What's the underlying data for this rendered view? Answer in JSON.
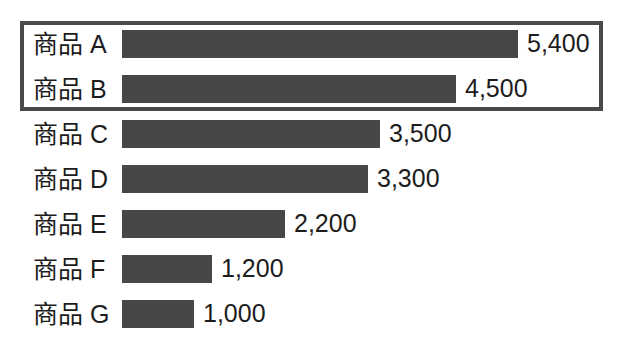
{
  "chart_data": {
    "type": "bar",
    "orientation": "horizontal",
    "title": "",
    "subtitle": "",
    "xlabel": "",
    "ylabel": "",
    "categories": [
      "商品 A",
      "商品 B",
      "商品 C",
      "商品 D",
      "商品 E",
      "商品 F",
      "商品 G"
    ],
    "values": [
      5400,
      4500,
      3500,
      3300,
      2200,
      1200,
      1000
    ],
    "value_labels": [
      "5,400",
      "4,500",
      "3,500",
      "3,300",
      "2,200",
      "1,200",
      "1,000"
    ],
    "xlim": [
      0,
      5400
    ],
    "grid": false,
    "legend": null,
    "annotations": [
      {
        "type": "highlight-rectangle",
        "covers_categories": [
          "商品 A",
          "商品 B"
        ],
        "color": "#4a4a4a"
      }
    ],
    "bar_color": "#474747",
    "text_color": "#1c1c1c",
    "background_color": "#ffffff"
  },
  "rows": [
    {
      "label": "商品 A",
      "value": 5400,
      "value_label": "5,400",
      "bar_px": 396,
      "highlighted": true
    },
    {
      "label": "商品 B",
      "value": 4500,
      "value_label": "4,500",
      "bar_px": 334,
      "highlighted": true
    },
    {
      "label": "商品 C",
      "value": 3500,
      "value_label": "3,500",
      "bar_px": 258,
      "highlighted": false
    },
    {
      "label": "商品 D",
      "value": 3300,
      "value_label": "3,300",
      "bar_px": 246,
      "highlighted": false
    },
    {
      "label": "商品 E",
      "value": 2200,
      "value_label": "2,200",
      "bar_px": 163,
      "highlighted": false
    },
    {
      "label": "商品 F",
      "value": 1200,
      "value_label": "1,200",
      "bar_px": 90,
      "highlighted": false
    },
    {
      "label": "商品 G",
      "value": 1000,
      "value_label": "1,000",
      "bar_px": 72,
      "highlighted": false
    }
  ]
}
